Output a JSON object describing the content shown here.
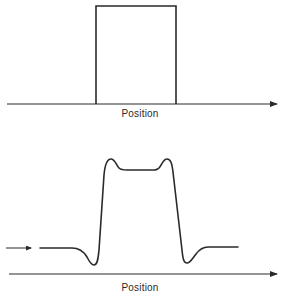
{
  "top_panel": {
    "axis_label": "Position",
    "description": "Ideal rectangular pulse (step up then step down) on a position axis"
  },
  "bottom_panel": {
    "axis_label": "Position",
    "description": "Measured/blurred profile with overshoot peaks at edges and undershoot dips below baseline"
  },
  "colors": {
    "stroke": "#2a2a2a",
    "background": "#ffffff"
  }
}
